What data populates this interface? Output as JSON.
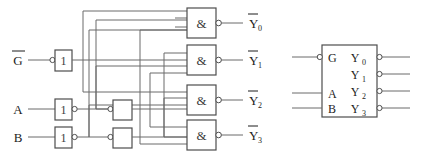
{
  "diagram": {
    "colors": {
      "wire": "#6b6b6b",
      "box_outline": "#4d4d4d",
      "text": "#1d1d1d",
      "background": "#ffffff"
    }
  },
  "inputs": [
    {
      "id": "g",
      "label": "G",
      "overbar": true,
      "y": 60
    },
    {
      "id": "a",
      "label": "A",
      "overbar": false,
      "y": 109
    },
    {
      "id": "b",
      "label": "B",
      "overbar": false,
      "y": 137
    }
  ],
  "stage1_inverters": [
    {
      "id": "inv-g",
      "glyph": "1",
      "bubble": "input",
      "x": 55,
      "y": 50
    },
    {
      "id": "inv-a",
      "glyph": "1",
      "bubble": "output",
      "x": 55,
      "y": 99
    },
    {
      "id": "inv-b",
      "glyph": "1",
      "bubble": "output",
      "x": 55,
      "y": 127
    }
  ],
  "stage2_inverters": [
    {
      "id": "inv-a2",
      "glyph": "",
      "bubble": "input",
      "x": 113,
      "y": 100
    },
    {
      "id": "inv-b2",
      "glyph": "",
      "bubble": "input",
      "x": 113,
      "y": 128
    }
  ],
  "nand_gates": [
    {
      "id": "nand-0",
      "glyph": "&",
      "x": 187,
      "y": 8,
      "inputs": 3,
      "output_bubble": true
    },
    {
      "id": "nand-1",
      "glyph": "&",
      "x": 187,
      "y": 45,
      "inputs": 3,
      "output_bubble": true
    },
    {
      "id": "nand-2",
      "glyph": "&",
      "x": 187,
      "y": 85,
      "inputs": 3,
      "output_bubble": true
    },
    {
      "id": "nand-3",
      "glyph": "&",
      "x": 187,
      "y": 120,
      "inputs": 3,
      "output_bubble": true
    }
  ],
  "outputs": [
    {
      "id": "y0",
      "label": "Y",
      "sub": "0",
      "overbar": true,
      "y": 23
    },
    {
      "id": "y1",
      "label": "Y",
      "sub": "1",
      "overbar": true,
      "y": 60
    },
    {
      "id": "y2",
      "label": "Y",
      "sub": "2",
      "overbar": true,
      "y": 100
    },
    {
      "id": "y3",
      "label": "Y",
      "sub": "3",
      "overbar": true,
      "y": 135
    }
  ],
  "block_symbol": {
    "x": 322,
    "y": 45,
    "width": 55,
    "height": 72,
    "inputs": [
      {
        "id": "blk-g",
        "label": "G",
        "bubble": true,
        "y": 57
      },
      {
        "id": "blk-a",
        "label": "A",
        "bubble": false,
        "y": 93
      },
      {
        "id": "blk-b",
        "label": "B",
        "bubble": false,
        "y": 108
      }
    ],
    "outputs": [
      {
        "id": "blk-y0",
        "label": "Y",
        "sub": "0",
        "bubble": true,
        "y": 57
      },
      {
        "id": "blk-y1",
        "label": "Y",
        "sub": "1",
        "bubble": true,
        "y": 74
      },
      {
        "id": "blk-y2",
        "label": "Y",
        "sub": "2",
        "bubble": true,
        "y": 91
      },
      {
        "id": "blk-y3",
        "label": "Y",
        "sub": "3",
        "bubble": true,
        "y": 108
      }
    ]
  }
}
